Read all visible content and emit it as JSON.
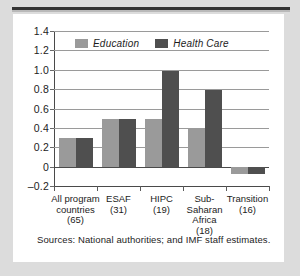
{
  "figure": {
    "source_note": "Sources:  National authorities; and IMF staff estimates."
  },
  "chart_data": {
    "type": "bar",
    "title": "",
    "subtitle": "",
    "xlabel": "",
    "ylabel": "",
    "ylim": [
      -0.2,
      1.4
    ],
    "yticks": [
      "1.4",
      "1.2",
      "1.0",
      "0.8",
      "0.6",
      "0.4",
      "0.2",
      "0",
      "–0.2"
    ],
    "ytick_values": [
      1.4,
      1.2,
      1.0,
      0.8,
      0.6,
      0.4,
      0.2,
      0,
      -0.2
    ],
    "grid": true,
    "legend_position": "top-left-inside",
    "categories": [
      "All program countries (65)",
      "ESAF (31)",
      "HIPC (19)",
      "Sub-Saharan Africa (18)",
      "Transition (16)"
    ],
    "category_lines": [
      [
        "All program",
        "countries",
        "(65)"
      ],
      [
        "ESAF",
        "(31)"
      ],
      [
        "HIPC",
        "(19)"
      ],
      [
        "Sub-",
        "Saharan",
        "Africa",
        "(18)"
      ],
      [
        "Transition",
        "(16)"
      ]
    ],
    "series": [
      {
        "name": "Education",
        "color": "#9a9a9a",
        "values": [
          0.3,
          0.49,
          0.49,
          0.39,
          -0.08
        ]
      },
      {
        "name": "Health Care",
        "color": "#4f4f4f",
        "values": [
          0.3,
          0.49,
          0.99,
          0.79,
          -0.08
        ]
      }
    ]
  },
  "legend": {
    "items": [
      {
        "label": "Education",
        "color": "#9a9a9a"
      },
      {
        "label": "Health Care",
        "color": "#4f4f4f"
      }
    ]
  }
}
